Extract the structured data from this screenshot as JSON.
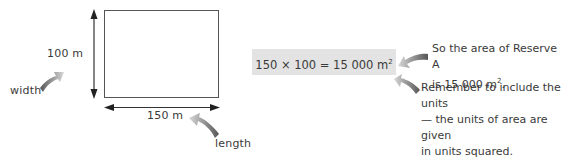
{
  "diagram": {
    "rectangle": {
      "name": "Reserve A"
    },
    "width_value": "100 m",
    "length_value": "150 m",
    "width_label": "width",
    "length_label": "length"
  },
  "equation": {
    "text": "150 × 100 = 15 000 m",
    "superscript": "2"
  },
  "notes": {
    "area_line1": "So the area of Reserve A",
    "area_line2": "is 15 000 m",
    "area_sup": "2",
    "area_end": ".",
    "units_line1": "Remember to include the units",
    "units_line2": "— the units of area are given",
    "units_line3": "in units squared."
  },
  "colors": {
    "arrow_dark": "#555555",
    "arrow_light": "#cfcfcf",
    "equation_bg": "#e3e3e3",
    "text": "#3a3a3a"
  }
}
